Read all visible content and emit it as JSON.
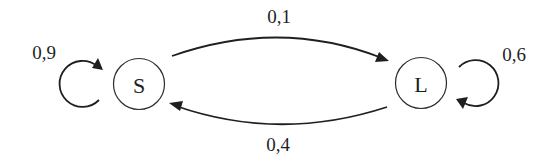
{
  "diagram": {
    "type": "markov-chain",
    "colors": {
      "stroke": "#1f1f1f",
      "background": "#ffffff"
    },
    "nodes": [
      {
        "id": "S",
        "label": "S"
      },
      {
        "id": "L",
        "label": "L"
      }
    ],
    "edges": [
      {
        "from": "S",
        "to": "S",
        "label": "0,9"
      },
      {
        "from": "S",
        "to": "L",
        "label": "0,1"
      },
      {
        "from": "L",
        "to": "S",
        "label": "0,4"
      },
      {
        "from": "L",
        "to": "L",
        "label": "0,6"
      }
    ]
  }
}
